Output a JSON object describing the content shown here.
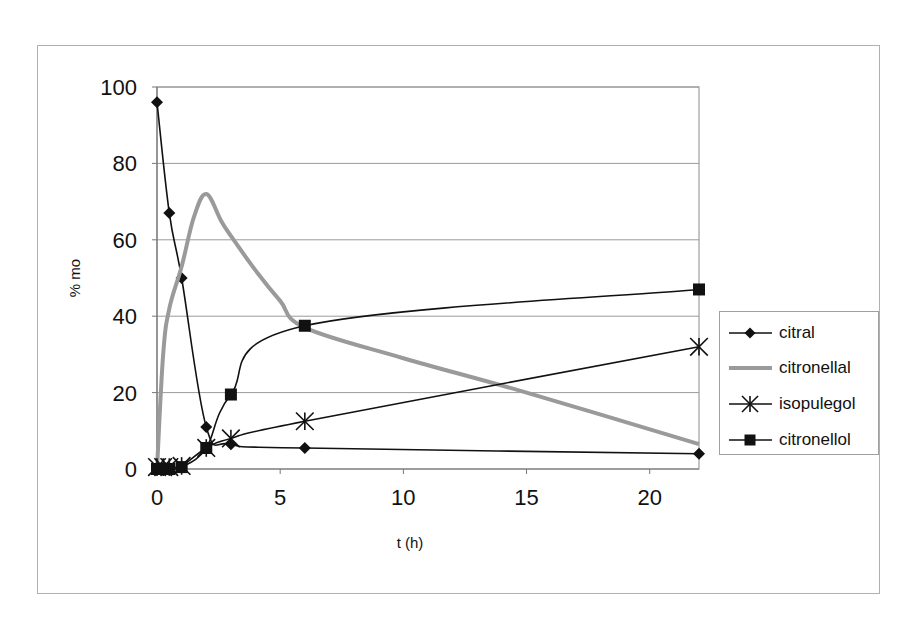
{
  "chart_data": {
    "type": "line",
    "title": "",
    "xlabel": "t (h)",
    "ylabel": "% mo",
    "xlim": [
      0,
      22
    ],
    "ylim": [
      0,
      100
    ],
    "x_ticks": [
      0,
      5,
      10,
      15,
      20
    ],
    "y_ticks": [
      0,
      20,
      40,
      60,
      80,
      100
    ],
    "grid": {
      "horizontal": true,
      "vertical": false
    },
    "legend_position": "right",
    "series": [
      {
        "name": "citral",
        "marker": "diamond",
        "color": "#111111",
        "x": [
          0,
          0.5,
          1,
          2,
          3,
          6,
          22
        ],
        "values": [
          96,
          67,
          50,
          11,
          6.5,
          5.5,
          4
        ]
      },
      {
        "name": "citronellal",
        "marker": "none",
        "color": "#9a9a9a",
        "x": [
          0,
          0.25,
          0.5,
          1,
          1.5,
          2,
          2.6,
          3,
          4,
          5,
          6,
          10,
          15,
          22
        ],
        "values": [
          0,
          30,
          42,
          53,
          66,
          72,
          65,
          61,
          52,
          44,
          37,
          29,
          20,
          6.5
        ]
      },
      {
        "name": "isopulegol",
        "marker": "asterisk",
        "color": "#111111",
        "x": [
          0,
          0.25,
          0.5,
          1,
          2,
          3,
          6,
          22
        ],
        "values": [
          0.5,
          0.5,
          0.5,
          0.8,
          5.5,
          8,
          12.5,
          32
        ]
      },
      {
        "name": "citronellol",
        "marker": "square",
        "color": "#111111",
        "x": [
          0,
          0.25,
          0.5,
          1,
          2,
          3,
          6,
          22
        ],
        "values": [
          0,
          0,
          0,
          0.5,
          5.5,
          19.5,
          37.5,
          47
        ]
      }
    ]
  },
  "legend": {
    "items": [
      {
        "label": "citral",
        "marker": "diamond"
      },
      {
        "label": "citronellal",
        "marker": "none"
      },
      {
        "label": "isopulegol",
        "marker": "asterisk"
      },
      {
        "label": "citronellol",
        "marker": "square"
      }
    ]
  },
  "axes": {
    "x_title": "t (h)",
    "y_title": "% mo"
  }
}
